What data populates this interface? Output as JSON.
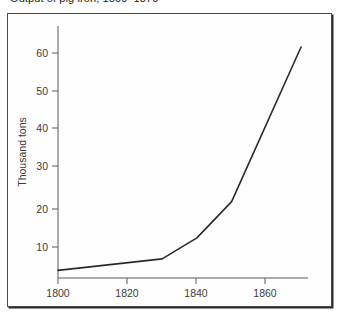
{
  "figure": {
    "caption": "Output of pig iron, 1800–1870",
    "background_color": "#ffffff",
    "frame_color": "#4a4a4a",
    "line_color": "#2a2a2a"
  },
  "chart_data": {
    "type": "line",
    "title": "Output of pig iron, 1800–1870",
    "xlabel": "",
    "ylabel": "Thousand tons",
    "xlim": [
      1800,
      1872
    ],
    "ylim": [
      0,
      66
    ],
    "grid": false,
    "legend": "none",
    "xticks": [
      1800,
      1820,
      1840,
      1860
    ],
    "xtick_labels": [
      "1800",
      "1820",
      "1840",
      "1860"
    ],
    "yticks": [
      10,
      20,
      30,
      40,
      50,
      60
    ],
    "ytick_labels": [
      "10",
      "20",
      "30",
      "40",
      "50",
      "60"
    ],
    "x": [
      1800,
      1830,
      1840,
      1850,
      1870
    ],
    "values": [
      2,
      5,
      10.5,
      20,
      60.5
    ],
    "series": [
      {
        "name": "Pig iron output",
        "x": [
          1800,
          1830,
          1840,
          1850,
          1870
        ],
        "values": [
          2,
          5,
          10.5,
          20,
          60.5
        ]
      }
    ]
  }
}
